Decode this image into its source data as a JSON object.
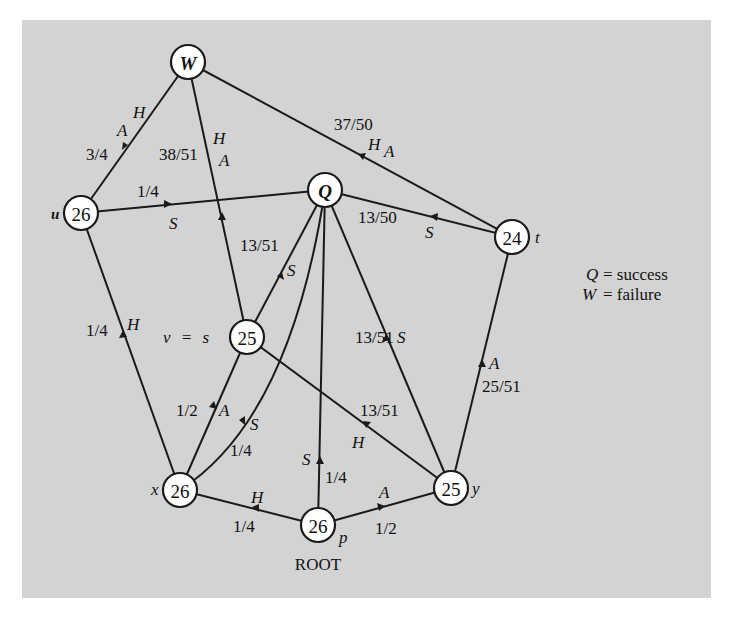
{
  "nodes": {
    "W": {
      "label": "W",
      "x": 188,
      "y": 62,
      "side": ""
    },
    "Q": {
      "label": "Q",
      "x": 325,
      "y": 190,
      "side": ""
    },
    "u": {
      "label": "26",
      "x": 81,
      "y": 213,
      "side": "u"
    },
    "t": {
      "label": "24",
      "x": 512,
      "y": 237,
      "side": "t"
    },
    "s": {
      "label": "25",
      "x": 247,
      "y": 337,
      "side": "v = s"
    },
    "x": {
      "label": "26",
      "x": 180,
      "y": 490,
      "side": "x"
    },
    "y": {
      "label": "25",
      "x": 451,
      "y": 488,
      "side": "y"
    },
    "p": {
      "label": "26",
      "x": 318,
      "y": 525,
      "side": "p"
    }
  },
  "root_label": "ROOT",
  "legend": {
    "q_symbol": "Q",
    "q_meaning": "= success",
    "w_symbol": "W",
    "w_meaning": "= failure"
  },
  "edges": [
    {
      "from": "u",
      "to": "W",
      "prob": "3/4",
      "moves": "A H"
    },
    {
      "from": "s",
      "to": "W",
      "prob": "38/51",
      "moves": "H A"
    },
    {
      "from": "t",
      "to": "W",
      "prob": "37/50",
      "moves": "H A"
    },
    {
      "from": "u",
      "to": "Q",
      "prob": "1/4",
      "moves": "S"
    },
    {
      "from": "t",
      "to": "Q",
      "prob": "13/50",
      "moves": "S"
    },
    {
      "from": "s",
      "to": "Q",
      "prob": "13/51",
      "moves": "S"
    },
    {
      "from": "x",
      "to": "u",
      "prob": "1/4",
      "moves": "H"
    },
    {
      "from": "x",
      "to": "s",
      "prob": "1/2",
      "moves": "A"
    },
    {
      "from": "x",
      "to": "Q",
      "prob": "1/4",
      "moves": "S"
    },
    {
      "from": "y",
      "to": "s",
      "prob": "13/51",
      "moves": "H"
    },
    {
      "from": "y",
      "to": "Q",
      "prob": "13/51",
      "moves": "S"
    },
    {
      "from": "y",
      "to": "t",
      "prob": "25/51",
      "moves": "A"
    },
    {
      "from": "p",
      "to": "x",
      "prob": "1/4",
      "moves": "H"
    },
    {
      "from": "p",
      "to": "Q",
      "prob": "1/4",
      "moves": "S"
    },
    {
      "from": "p",
      "to": "y",
      "prob": "1/2",
      "moves": "A"
    }
  ],
  "labels": {
    "uW_prob": "3/4",
    "uW_A": "A",
    "uW_H": "H",
    "sW_prob": "38/51",
    "sW_H": "H",
    "sW_A": "A",
    "tW_prob": "37/50",
    "tW_H": "H",
    "tW_A": "A",
    "uQ_prob": "1/4",
    "uQ_S": "S",
    "tQ_prob": "13/50",
    "tQ_S": "S",
    "sQ_prob": "13/51",
    "sQ_S": "S",
    "xu_prob": "1/4",
    "xu_H": "H",
    "xs_prob": "1/2",
    "xs_A": "A",
    "xQ_prob": "1/4",
    "xQ_S": "S",
    "ys_prob": "13/51",
    "ys_H": "H",
    "yQ_prob": "13/51",
    "yQ_S": "S",
    "yt_prob": "25/51",
    "yt_A": "A",
    "px_prob": "1/4",
    "px_H": "H",
    "pQ_prob": "1/4",
    "pQ_S": "S",
    "py_prob": "1/2",
    "py_A": "A"
  }
}
